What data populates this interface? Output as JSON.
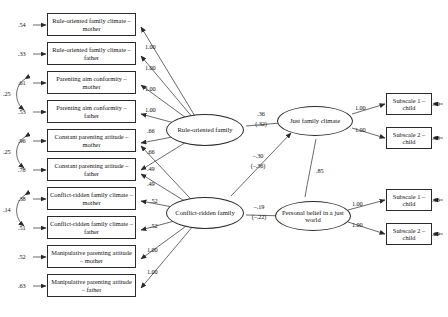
{
  "diagram": {
    "type": "structural-equation-model",
    "title": "",
    "indicators": [
      {
        "id": "ind1",
        "label": "Rule-oriented family climate – mother",
        "error": ".54"
      },
      {
        "id": "ind2",
        "label": "Rule-oriented family climate – father",
        "error": ".33"
      },
      {
        "id": "ind3",
        "label": "Parenting aim conformity – mother",
        "error": ".61"
      },
      {
        "id": "ind4",
        "label": "Parenting aim conformity – father",
        "error": ".53"
      },
      {
        "id": "ind5",
        "label": "Constant parenting attitude – mother",
        "error": ".96"
      },
      {
        "id": "ind6",
        "label": "Constant parenting attitude – father",
        "error": ".78"
      },
      {
        "id": "ind7",
        "label": "Conflict-ridden family climate – mother",
        "error": ".38"
      },
      {
        "id": "ind8",
        "label": "Conflict-ridden family climate – father",
        "error": ".51"
      },
      {
        "id": "ind9",
        "label": "Manipulative parenting attitude – mother",
        "error": ".52"
      },
      {
        "id": "ind10",
        "label": "Manipulative parenting attitude – father",
        "error": ".63"
      }
    ],
    "error_correlations": [
      {
        "id": "corr1",
        "value": ".25",
        "between": [
          "ind3",
          "ind4"
        ]
      },
      {
        "id": "corr2",
        "value": ".25",
        "between": [
          "ind5",
          "ind6"
        ]
      },
      {
        "id": "corr3",
        "value": ".14",
        "between": [
          "ind7",
          "ind8"
        ]
      }
    ],
    "latents": [
      {
        "id": "rule",
        "label": "Rule-oriented family"
      },
      {
        "id": "conflict",
        "label": "Conflict-ridden family"
      },
      {
        "id": "just",
        "label": "Just family climate"
      },
      {
        "id": "belief",
        "label": "Personal belief in a just world"
      }
    ],
    "loadings": [
      {
        "id": "l1",
        "from": "rule",
        "to": "ind1",
        "value": "1.00"
      },
      {
        "id": "l2",
        "from": "rule",
        "to": "ind2",
        "value": "1.00"
      },
      {
        "id": "l3",
        "from": "rule",
        "to": "ind3",
        "value": "1.00"
      },
      {
        "id": "l4",
        "from": "rule",
        "to": "ind4",
        "value": "1.00"
      },
      {
        "id": "l5",
        "from": "rule",
        "to": "ind5",
        "value": ".66"
      },
      {
        "id": "l6",
        "from": "rule",
        "to": "ind6",
        "value": ".66"
      },
      {
        "id": "l7",
        "from": "conflict",
        "to": "ind5",
        "value": ".49"
      },
      {
        "id": "l8",
        "from": "conflict",
        "to": "ind6",
        "value": ".49"
      },
      {
        "id": "l9",
        "from": "conflict",
        "to": "ind7",
        "value": ".52"
      },
      {
        "id": "l10",
        "from": "conflict",
        "to": "ind8",
        "value": ".52"
      },
      {
        "id": "l11",
        "from": "conflict",
        "to": "ind9",
        "value": "1.00"
      },
      {
        "id": "l12",
        "from": "conflict",
        "to": "ind10",
        "value": "1.00"
      }
    ],
    "subscales": [
      {
        "id": "s1",
        "label": "Subscale 1 – child",
        "error": ".30",
        "loading": "1.00",
        "from": "just"
      },
      {
        "id": "s2",
        "label": "Subscale 2 – child",
        "error": ".38",
        "loading": "1.00",
        "from": "just"
      },
      {
        "id": "s3",
        "label": "Subscale 1 – child",
        "error": ".16",
        "loading": "1.00",
        "from": "belief"
      },
      {
        "id": "s4",
        "label": "Subscale 2 – child",
        "error": ".29",
        "loading": "1.00",
        "from": "belief"
      }
    ],
    "structural_paths": [
      {
        "id": "p1",
        "from": "rule",
        "to": "just",
        "value": ".36",
        "standardized": "(.32)"
      },
      {
        "id": "p2",
        "from": "rule",
        "to": "belief",
        "value": "–.30",
        "standardized": "(–.36)"
      },
      {
        "id": "p3",
        "from": "conflict",
        "to": "belief",
        "value": "–.19",
        "standardized": "(–.22)"
      },
      {
        "id": "p4",
        "from": "just",
        "to": "belief",
        "value": ".85",
        "standardized": ""
      }
    ]
  }
}
